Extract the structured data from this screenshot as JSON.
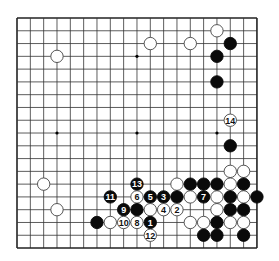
{
  "board": {
    "size": 19,
    "origin_x": 17,
    "origin_y": 18,
    "cell_w": 13.33,
    "cell_h": 12.78,
    "line_color": "#333333",
    "edge_color": "#222222",
    "background": "#ffffff",
    "star_points": [
      [
        3,
        3
      ],
      [
        9,
        3
      ],
      [
        15,
        3
      ],
      [
        3,
        9
      ],
      [
        9,
        9
      ],
      [
        15,
        9
      ]
    ]
  },
  "colors": {
    "black": "#0a0a0a",
    "white": "#ffffff",
    "white_outline": "#444444"
  },
  "stones": [
    {
      "c": "W",
      "x": 15,
      "y": 1
    },
    {
      "c": "B",
      "x": 16,
      "y": 2
    },
    {
      "c": "W",
      "x": 10,
      "y": 2
    },
    {
      "c": "W",
      "x": 13,
      "y": 2
    },
    {
      "c": "W",
      "x": 3,
      "y": 3
    },
    {
      "c": "B",
      "x": 15,
      "y": 3
    },
    {
      "c": "B",
      "x": 15,
      "y": 5
    },
    {
      "c": "W",
      "x": 16,
      "y": 8,
      "n": "14"
    },
    {
      "c": "B",
      "x": 16,
      "y": 10
    },
    {
      "c": "W",
      "x": 16,
      "y": 12
    },
    {
      "c": "W",
      "x": 17,
      "y": 12
    },
    {
      "c": "W",
      "x": 2,
      "y": 13
    },
    {
      "c": "B",
      "x": 9,
      "y": 13,
      "n": "13"
    },
    {
      "c": "W",
      "x": 12,
      "y": 13
    },
    {
      "c": "B",
      "x": 13,
      "y": 13
    },
    {
      "c": "B",
      "x": 14,
      "y": 13
    },
    {
      "c": "B",
      "x": 15,
      "y": 13
    },
    {
      "c": "W",
      "x": 16,
      "y": 13
    },
    {
      "c": "B",
      "x": 17,
      "y": 13
    },
    {
      "c": "B",
      "x": 7,
      "y": 14,
      "n": "11"
    },
    {
      "c": "W",
      "x": 9,
      "y": 14,
      "n": "6"
    },
    {
      "c": "B",
      "x": 10,
      "y": 14,
      "n": "5"
    },
    {
      "c": "B",
      "x": 11,
      "y": 14,
      "n": "3"
    },
    {
      "c": "B",
      "x": 12,
      "y": 14
    },
    {
      "c": "W",
      "x": 13,
      "y": 14
    },
    {
      "c": "B",
      "x": 14,
      "y": 14,
      "n": "7"
    },
    {
      "c": "W",
      "x": 15,
      "y": 14
    },
    {
      "c": "B",
      "x": 16,
      "y": 14
    },
    {
      "c": "W",
      "x": 17,
      "y": 14
    },
    {
      "c": "B",
      "x": 18,
      "y": 14
    },
    {
      "c": "W",
      "x": 3,
      "y": 15
    },
    {
      "c": "B",
      "x": 8,
      "y": 15,
      "n": "9"
    },
    {
      "c": "B",
      "x": 9,
      "y": 15
    },
    {
      "c": "W",
      "x": 10,
      "y": 15
    },
    {
      "c": "W",
      "x": 11,
      "y": 15,
      "n": "4"
    },
    {
      "c": "W",
      "x": 12,
      "y": 15,
      "n": "2"
    },
    {
      "c": "W",
      "x": 15,
      "y": 15
    },
    {
      "c": "B",
      "x": 16,
      "y": 15
    },
    {
      "c": "B",
      "x": 17,
      "y": 15
    },
    {
      "c": "B",
      "x": 6,
      "y": 16
    },
    {
      "c": "W",
      "x": 7,
      "y": 16
    },
    {
      "c": "W",
      "x": 8,
      "y": 16,
      "n": "10"
    },
    {
      "c": "W",
      "x": 9,
      "y": 16,
      "n": "8"
    },
    {
      "c": "B",
      "x": 10,
      "y": 16,
      "n": "1"
    },
    {
      "c": "W",
      "x": 13,
      "y": 16
    },
    {
      "c": "W",
      "x": 14,
      "y": 16
    },
    {
      "c": "B",
      "x": 15,
      "y": 16
    },
    {
      "c": "W",
      "x": 16,
      "y": 16
    },
    {
      "c": "W",
      "x": 17,
      "y": 16
    },
    {
      "c": "W",
      "x": 10,
      "y": 17,
      "n": "12"
    },
    {
      "c": "B",
      "x": 14,
      "y": 17
    },
    {
      "c": "B",
      "x": 15,
      "y": 17
    },
    {
      "c": "B",
      "x": 17,
      "y": 17
    }
  ]
}
